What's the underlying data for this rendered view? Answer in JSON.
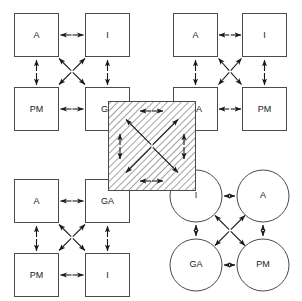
{
  "figure": {
    "background_color": "#ffffff",
    "line_color": "#1a1a1a",
    "shape_stroke_color": "#4a4a4a",
    "shape_fill_color": "#ffffff",
    "hatch_color": "#7a7a7a",
    "width": 302,
    "height": 301
  },
  "panels": [
    {
      "id": "top-left",
      "shape_type": "rect",
      "nodes": [
        {
          "pos": "top-left",
          "label": "A"
        },
        {
          "pos": "top-right",
          "label": "I"
        },
        {
          "pos": "bottom-left",
          "label": "PM"
        },
        {
          "pos": "bottom-right",
          "label": "GA"
        }
      ],
      "connections": [
        "top-horizontal",
        "bottom-horizontal",
        "left-vertical",
        "right-vertical",
        "diagonal-tl-br",
        "diagonal-tr-bl"
      ]
    },
    {
      "id": "top-right",
      "shape_type": "rect",
      "nodes": [
        {
          "pos": "top-left",
          "label": "A"
        },
        {
          "pos": "top-right",
          "label": "I"
        },
        {
          "pos": "bottom-left",
          "label": "GA"
        },
        {
          "pos": "bottom-right",
          "label": "PM"
        }
      ],
      "connections": [
        "top-horizontal",
        "bottom-horizontal",
        "left-vertical",
        "right-vertical",
        "diagonal-tl-br",
        "diagonal-tr-bl"
      ]
    },
    {
      "id": "bottom-left",
      "shape_type": "rect",
      "nodes": [
        {
          "pos": "top-left",
          "label": "A"
        },
        {
          "pos": "top-right",
          "label": "GA"
        },
        {
          "pos": "bottom-left",
          "label": "PM"
        },
        {
          "pos": "bottom-right",
          "label": "I"
        }
      ],
      "connections": [
        "top-horizontal",
        "bottom-horizontal",
        "left-vertical",
        "right-vertical",
        "diagonal-tl-br",
        "diagonal-tr-bl"
      ]
    },
    {
      "id": "bottom-right",
      "shape_type": "circle",
      "nodes": [
        {
          "pos": "top-left",
          "label": "I"
        },
        {
          "pos": "top-right",
          "label": "A"
        },
        {
          "pos": "bottom-left",
          "label": "GA"
        },
        {
          "pos": "bottom-right",
          "label": "PM"
        }
      ],
      "connections": [
        "top-horizontal",
        "bottom-horizontal",
        "left-vertical",
        "right-vertical",
        "diagonal-tl-br",
        "diagonal-tr-bl"
      ]
    }
  ],
  "center_overlay": {
    "id": "center-hatched-square",
    "fill_pattern": "diagonal-hatch",
    "hatch_angle_degrees": 45,
    "x": 108,
    "y": 101,
    "width": 88,
    "height": 90,
    "connections": [
      "top-horizontal",
      "bottom-horizontal",
      "left-vertical",
      "right-vertical",
      "diagonal-tl-br",
      "diagonal-tr-bl"
    ]
  }
}
